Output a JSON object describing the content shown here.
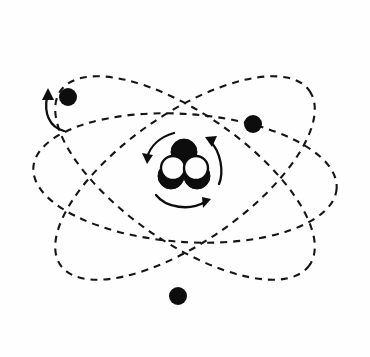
{
  "figure": {
    "title": "Atom diagram",
    "caption": "Schematic line drawing of an atom: a dense nucleus of overlapping nucleons at the centre, encircled by three dashed elliptical electron orbits, each carrying one electron.",
    "background_color": "#fefefe",
    "ink_color": "#0d0d0d",
    "width": 370,
    "height": 357
  },
  "nucleus": {
    "label": "nucleus",
    "center": {
      "x": 184,
      "y": 165
    },
    "nucleon_count": 5,
    "nucleons": [
      {
        "name": "nucleon-top-dark",
        "kind": "dark",
        "cx": 184,
        "cy": 152,
        "r": 13
      },
      {
        "name": "nucleon-left-light",
        "kind": "light",
        "cx": 173,
        "cy": 168,
        "r": 13
      },
      {
        "name": "nucleon-right-light",
        "kind": "light",
        "cx": 196,
        "cy": 168,
        "r": 13
      },
      {
        "name": "nucleon-bottom-left-dark",
        "kind": "dark",
        "cx": 171,
        "cy": 176,
        "r": 13
      },
      {
        "name": "nucleon-bottom-right-dark",
        "kind": "dark",
        "cx": 197,
        "cy": 176,
        "r": 13
      }
    ],
    "dark_fill": "#0d0d0d",
    "light_fill": "#fdfdfd"
  },
  "spin_arrows": [
    {
      "name": "nucleus-spin-arrow-left",
      "description": "curved arrow sweeping down and to the left of the nucleus",
      "path": "M 174 133 C 160 137, 150 146, 147 158",
      "head": "147,164 142,153 153,155",
      "direction": "counterclockwise"
    },
    {
      "name": "nucleus-spin-arrow-right",
      "description": "curved arrow sweeping up and to the right of the nucleus",
      "path": "M 219 184 C 224 172, 221 152, 210 141",
      "head": "205,137 217,136, 212,147",
      "direction": "counterclockwise"
    },
    {
      "name": "nucleus-spin-arrow-bottom",
      "description": "curved arrow sweeping left to right beneath the nucleus",
      "path": "M 156 195 C 166 208, 190 211, 205 202",
      "head": "211,199 203,208, 202,197",
      "direction": "clockwise"
    }
  ],
  "orbits": [
    {
      "name": "orbit-upper-left",
      "label": "Orbit 1",
      "tilt_degrees": -35,
      "rx": 152,
      "ry": 64,
      "cx": 185,
      "cy": 178,
      "style": "dashed"
    },
    {
      "name": "orbit-upper-right",
      "label": "Orbit 2",
      "tilt_degrees": 35,
      "rx": 152,
      "ry": 64,
      "cx": 185,
      "cy": 178,
      "style": "dashed"
    },
    {
      "name": "orbit-horizontal",
      "label": "Orbit 3",
      "tilt_degrees": 4,
      "rx": 152,
      "ry": 64,
      "cx": 185,
      "cy": 178,
      "style": "dashed"
    }
  ],
  "electrons": [
    {
      "name": "electron-upper-left",
      "label": "Electron 1",
      "cx": 68,
      "cy": 97,
      "r": 9,
      "on_orbit": "orbit-upper-right",
      "motion_arrow": {
        "name": "electron-upper-left-motion-arrow",
        "path": "M 64 131 C 49 127, 44 113, 47 97",
        "head": "48,88 54,100, 42,100",
        "direction": "upward"
      }
    },
    {
      "name": "electron-right",
      "label": "Electron 2",
      "cx": 253,
      "cy": 124,
      "r": 9,
      "on_orbit": "orbit-horizontal",
      "motion_arrow": null
    },
    {
      "name": "electron-bottom",
      "label": "Electron 3",
      "cx": 178,
      "cy": 296,
      "r": 9,
      "on_orbit": "orbit-upper-left",
      "motion_arrow": null
    }
  ]
}
